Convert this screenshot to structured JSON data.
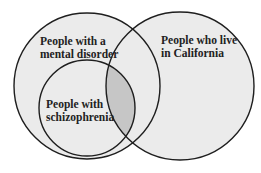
{
  "diagram": {
    "type": "venn",
    "sets": [
      {
        "id": "mental",
        "label_lines": [
          "People with a",
          "mental disorder"
        ],
        "cx": 87,
        "cy": 86,
        "r": 73
      },
      {
        "id": "california",
        "label_lines": [
          "People who live",
          "in California"
        ],
        "cx": 180,
        "cy": 86,
        "r": 74
      },
      {
        "id": "schizophrenia",
        "label_lines": [
          "People with",
          "schizophrenia"
        ],
        "cx": 87,
        "cy": 108,
        "r": 48
      }
    ],
    "highlight": "schizophrenia ∩ california",
    "colors": {
      "circle_fill": "#ebebeb",
      "highlight_fill": "#c6c6c6",
      "stroke": "#1e1e1e",
      "background": "#ffffff"
    }
  }
}
